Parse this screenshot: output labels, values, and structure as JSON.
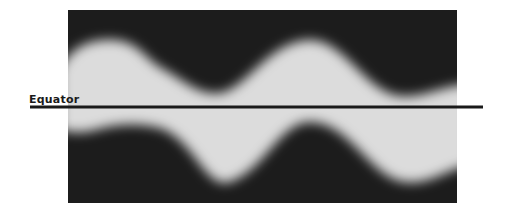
{
  "diagram": {
    "label": "Equator",
    "colors": {
      "background": "#1c1c1c",
      "band": "#dcdcdc",
      "line": "#1a1a1a",
      "page": "#ffffff"
    }
  }
}
